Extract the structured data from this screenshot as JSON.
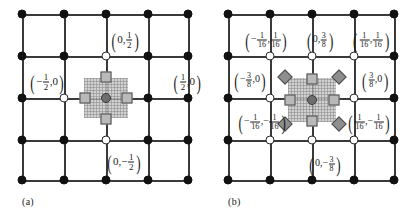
{
  "figure": {
    "type": "stencil-diagram",
    "panels": [
      {
        "id": "a",
        "caption": "(a)",
        "grid": {
          "rows": 5,
          "cols": 5,
          "filled_nodes": "all except open nodes",
          "open_nodes": [
            [
              1,
              2
            ],
            [
              2,
              1
            ],
            [
              2,
              3
            ],
            [
              3,
              2
            ]
          ]
        },
        "stencil": {
          "center_marker": "circle",
          "edge_markers": [
            "square",
            "square",
            "square",
            "square"
          ],
          "diagonal_markers": [],
          "hatch_patch": true
        },
        "labels": [
          {
            "name": "label-north",
            "x_num": "0",
            "y_num": "1",
            "y_den": "2",
            "y_sign": "",
            "text": "(0, 1/2)"
          },
          {
            "name": "label-west",
            "x_num": "1",
            "x_den": "2",
            "x_sign": "-",
            "y_num": "0",
            "text": "(-1/2, 0)"
          },
          {
            "name": "label-east",
            "x_num": "1",
            "x_den": "2",
            "x_sign": "",
            "y_num": "0",
            "text": "(1/2, 0)"
          },
          {
            "name": "label-south",
            "x_num": "0",
            "y_num": "1",
            "y_den": "2",
            "y_sign": "-",
            "text": "(0, -1/2)"
          }
        ]
      },
      {
        "id": "b",
        "caption": "(b)",
        "grid": {
          "rows": 5,
          "cols": 5,
          "open_nodes": [
            [
              1,
              1
            ],
            [
              1,
              2
            ],
            [
              1,
              3
            ],
            [
              2,
              1
            ],
            [
              2,
              3
            ],
            [
              3,
              1
            ],
            [
              3,
              2
            ],
            [
              3,
              3
            ]
          ]
        },
        "stencil": {
          "center_marker": "circle",
          "edge_markers": [
            "square",
            "square",
            "square",
            "square"
          ],
          "diagonal_markers": [
            "diamond",
            "diamond",
            "diamond",
            "diamond"
          ],
          "hatch_patch": true
        },
        "labels": [
          {
            "name": "label-nw",
            "text": "(-1/16, 1/16)"
          },
          {
            "name": "label-n",
            "text": "(0, 3/8)"
          },
          {
            "name": "label-ne",
            "text": "(1/16, 1/16)"
          },
          {
            "name": "label-w",
            "text": "(-3/8, 0)"
          },
          {
            "name": "label-e",
            "text": "(3/8, 0)"
          },
          {
            "name": "label-sw",
            "text": "(-1/16, -1/16)"
          },
          {
            "name": "label-se",
            "text": "(1/16, -1/16)"
          },
          {
            "name": "label-s",
            "text": "(0, -3/8)"
          }
        ]
      }
    ]
  },
  "text": {
    "caption_a": "(a)",
    "caption_b": "(b)",
    "zero": "0",
    "one": "1",
    "two": "2",
    "three": "3",
    "eight": "8",
    "sixteen": "16",
    "minus": "−",
    "comma": ",",
    "lparen": "(",
    "rparen": ")"
  },
  "colors": {
    "line": "#3a3a3a",
    "node_filled": "#111111",
    "node_open_border": "#2b2b2b",
    "square_fill": "#b9b9b9",
    "diamond_fill": "#8e8e8e",
    "center_fill": "#6e6e6e",
    "hatch": "#c9c9c9",
    "background": "#ffffff"
  }
}
